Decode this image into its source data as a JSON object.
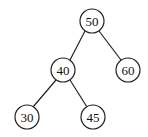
{
  "tree": {
    "nodes": [
      {
        "id": "n50",
        "label": "50",
        "x": 92,
        "y": 21
      },
      {
        "id": "n40",
        "label": "40",
        "x": 63,
        "y": 70
      },
      {
        "id": "n60",
        "label": "60",
        "x": 128,
        "y": 70
      },
      {
        "id": "n30",
        "label": "30",
        "x": 27,
        "y": 117
      },
      {
        "id": "n45",
        "label": "45",
        "x": 93,
        "y": 117
      }
    ],
    "edges": [
      {
        "from": "n50",
        "to": "n40"
      },
      {
        "from": "n50",
        "to": "n60"
      },
      {
        "from": "n40",
        "to": "n30"
      },
      {
        "from": "n40",
        "to": "n45"
      }
    ],
    "radius": 12
  }
}
